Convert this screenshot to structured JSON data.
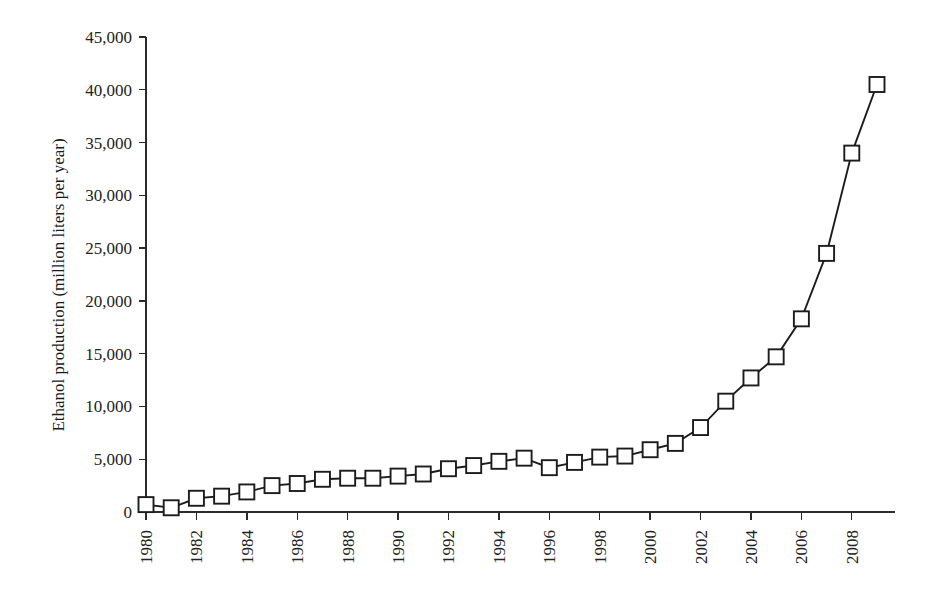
{
  "chart_data": {
    "type": "line",
    "title": "",
    "xlabel": "",
    "ylabel": "Ethanol production (million liters per year)",
    "x": [
      1980,
      1981,
      1982,
      1983,
      1984,
      1985,
      1986,
      1987,
      1988,
      1989,
      1990,
      1991,
      1992,
      1993,
      1994,
      1995,
      1996,
      1997,
      1998,
      1999,
      2000,
      2001,
      2002,
      2003,
      2004,
      2005,
      2006,
      2007,
      2008,
      2009
    ],
    "values": [
      700,
      400,
      1300,
      1500,
      1900,
      2500,
      2700,
      3100,
      3200,
      3200,
      3400,
      3600,
      4100,
      4400,
      4800,
      5100,
      4200,
      4700,
      5200,
      5300,
      5900,
      6500,
      8000,
      10500,
      12700,
      14700,
      18300,
      24500,
      34000,
      40500
    ],
    "series": [
      {
        "name": "Ethanol production",
        "values": [
          700,
          400,
          1300,
          1500,
          1900,
          2500,
          2700,
          3100,
          3200,
          3200,
          3400,
          3600,
          4100,
          4400,
          4800,
          5100,
          4200,
          4700,
          5200,
          5300,
          5900,
          6500,
          8000,
          10500,
          12700,
          14700,
          18300,
          24500,
          34000,
          40500
        ]
      }
    ],
    "ylim": [
      0,
      45000
    ],
    "xlim": [
      1980,
      2009
    ],
    "yticks": [
      0,
      5000,
      10000,
      15000,
      20000,
      25000,
      30000,
      35000,
      40000,
      45000
    ],
    "ytick_labels": [
      "0",
      "5,000",
      "10,000",
      "15,000",
      "20,000",
      "25,000",
      "30,000",
      "35,000",
      "40,000",
      "45,000"
    ],
    "xticks": [
      1980,
      1982,
      1984,
      1986,
      1988,
      1990,
      1992,
      1994,
      1996,
      1998,
      2000,
      2002,
      2004,
      2006,
      2008
    ],
    "xtick_labels": [
      "1980",
      "1982",
      "1984",
      "1986",
      "1988",
      "1990",
      "1992",
      "1994",
      "1996",
      "1998",
      "2000",
      "2002",
      "2004",
      "2006",
      "2008"
    ],
    "grid": false,
    "legend": false,
    "legend_position": "none",
    "marker": "open-square",
    "line_color": "#1c1c1c",
    "marker_fill": "#ffffff",
    "background": "#ffffff",
    "xtick_label_rotation": -90
  }
}
